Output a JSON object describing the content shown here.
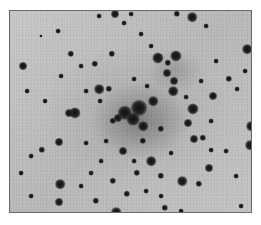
{
  "image": {
    "subject": "star-cluster-negative",
    "frame": {
      "left": 9,
      "top": 10,
      "width": 243,
      "height": 203
    },
    "colors": {
      "background": "#bdbdbd",
      "star": "#111111",
      "border": "#6a6a6a"
    },
    "stars": [
      [
        114,
        13,
        5
      ],
      [
        176,
        13,
        4
      ],
      [
        130,
        13,
        3
      ],
      [
        191,
        16,
        6
      ],
      [
        98,
        15,
        3
      ],
      [
        22,
        65,
        5
      ],
      [
        246,
        48,
        6
      ],
      [
        70,
        53,
        4
      ],
      [
        111,
        53,
        4
      ],
      [
        94,
        63,
        4
      ],
      [
        157,
        57,
        7
      ],
      [
        175,
        55,
        7
      ],
      [
        167,
        62,
        4
      ],
      [
        166,
        72,
        5
      ],
      [
        173,
        80,
        5
      ],
      [
        172,
        90,
        6
      ],
      [
        98,
        88,
        6
      ],
      [
        108,
        88,
        4
      ],
      [
        133,
        78,
        3
      ],
      [
        124,
        112,
        9
      ],
      [
        138,
        107,
        10
      ],
      [
        132,
        118,
        8
      ],
      [
        152,
        100,
        6
      ],
      [
        142,
        125,
        6
      ],
      [
        117,
        117,
        5
      ],
      [
        74,
        112,
        7
      ],
      [
        68,
        112,
        5
      ],
      [
        112,
        120,
        4
      ],
      [
        192,
        108,
        7
      ],
      [
        212,
        95,
        5
      ],
      [
        228,
        78,
        4
      ],
      [
        244,
        70,
        3
      ],
      [
        250,
        125,
        6
      ],
      [
        249,
        144,
        6
      ],
      [
        187,
        122,
        5
      ],
      [
        193,
        138,
        5
      ],
      [
        202,
        137,
        4
      ],
      [
        210,
        149,
        3
      ],
      [
        58,
        141,
        5
      ],
      [
        41,
        149,
        4
      ],
      [
        30,
        155,
        3
      ],
      [
        122,
        150,
        5
      ],
      [
        150,
        160,
        6
      ],
      [
        160,
        175,
        4
      ],
      [
        181,
        180,
        6
      ],
      [
        208,
        167,
        5
      ],
      [
        198,
        183,
        4
      ],
      [
        59,
        183,
        6
      ],
      [
        164,
        207,
        4
      ],
      [
        115,
        211,
        6
      ],
      [
        95,
        200,
        4
      ],
      [
        58,
        201,
        5
      ],
      [
        112,
        180,
        4
      ],
      [
        90,
        172,
        3
      ],
      [
        136,
        172,
        4
      ],
      [
        126,
        193,
        4
      ],
      [
        142,
        140,
        4
      ],
      [
        160,
        128,
        4
      ],
      [
        105,
        140,
        3
      ],
      [
        85,
        142,
        3
      ],
      [
        44,
        100,
        3
      ],
      [
        26,
        90,
        3
      ],
      [
        60,
        75,
        3
      ],
      [
        80,
        65,
        3
      ],
      [
        150,
        45,
        3
      ],
      [
        215,
        60,
        3
      ],
      [
        236,
        88,
        3
      ],
      [
        210,
        120,
        3
      ],
      [
        225,
        150,
        3
      ],
      [
        235,
        175,
        3
      ],
      [
        20,
        172,
        3
      ],
      [
        30,
        195,
        3
      ],
      [
        160,
        195,
        3
      ],
      [
        180,
        210,
        3
      ],
      [
        240,
        205,
        3
      ],
      [
        123,
        22,
        3
      ],
      [
        140,
        33,
        3
      ],
      [
        57,
        30,
        3
      ],
      [
        40,
        35,
        2
      ],
      [
        205,
        25,
        3
      ],
      [
        85,
        90,
        3
      ],
      [
        99,
        100,
        3
      ],
      [
        146,
        85,
        3
      ],
      [
        185,
        96,
        3
      ],
      [
        200,
        80,
        3
      ],
      [
        170,
        152,
        3
      ],
      [
        133,
        160,
        3
      ],
      [
        100,
        160,
        3
      ],
      [
        80,
        185,
        3
      ],
      [
        145,
        190,
        3
      ]
    ]
  }
}
